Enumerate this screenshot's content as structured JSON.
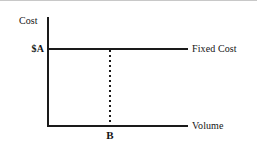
{
  "chart_data": {
    "type": "line",
    "title": "",
    "subtitle": "",
    "xlabel": "Volume",
    "ylabel": "Cost",
    "grid": false,
    "legend_position": "right-inline",
    "xlim": [
      0,
      1
    ],
    "ylim": [
      0,
      1
    ],
    "series": [
      {
        "name": "Fixed Cost",
        "style": "solid",
        "x": [
          0,
          1
        ],
        "values": [
          "$A",
          "$A"
        ],
        "description": "Horizontal line at cost level $A, constant across all volumes"
      },
      {
        "name": "B reference dropline",
        "style": "dotted",
        "x": [
          "B",
          "B"
        ],
        "values": [
          "$A",
          0
        ],
        "description": "Vertical dotted line from the fixed cost line down to the volume axis at volume B"
      }
    ],
    "annotations": [
      {
        "text": "Cost",
        "role": "y-axis-label"
      },
      {
        "text": "$A",
        "role": "y-axis-tick-label"
      },
      {
        "text": "Fixed Cost",
        "role": "series-label"
      },
      {
        "text": "Volume",
        "role": "x-axis-label"
      },
      {
        "text": "B",
        "role": "x-axis-tick-label"
      }
    ]
  },
  "axes": {
    "y_axis_title": "Cost",
    "x_axis_title": "Volume",
    "y_tick_label": "$A",
    "x_tick_label": "B"
  },
  "labels": {
    "cost": "Cost",
    "value_a": "$A",
    "fixed_cost": "Fixed Cost",
    "volume": "Volume",
    "volume_b": "B"
  },
  "colors": {
    "ink": "#1a1a1a",
    "background": "#ffffff",
    "top_rule": "#9a9a9a"
  }
}
